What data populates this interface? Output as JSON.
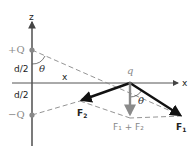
{
  "diagram": {
    "axes": {
      "z_label": "z",
      "x_label": "x",
      "x_distance_label": "x"
    },
    "charges": {
      "positive_label": "+Q",
      "negative_label": "−Q",
      "test_charge_label": "q"
    },
    "distances": {
      "upper_half": "d/2",
      "lower_half": "d/2"
    },
    "angles": {
      "at_positive_charge": "θ",
      "at_test_charge": "θ"
    },
    "forces": {
      "f1_label": "F",
      "f1_sub": "1",
      "f2_label": "F",
      "f2_sub": "2",
      "sum_label": "F₁ + F₂"
    },
    "colors": {
      "axis": "#555555",
      "force": "#111111",
      "resultant": "#8a8a8a",
      "dashed": "#888888",
      "charge": "#888888"
    }
  }
}
